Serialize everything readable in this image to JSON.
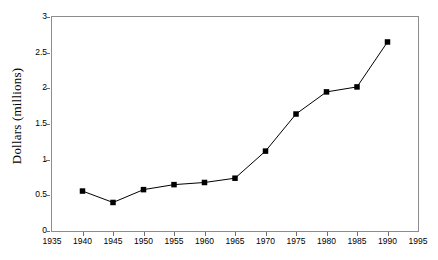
{
  "chart_data": {
    "type": "line",
    "title": "",
    "xlabel": "",
    "ylabel": "Dollars (millions)",
    "x": [
      1940,
      1945,
      1950,
      1955,
      1960,
      1965,
      1970,
      1975,
      1980,
      1985,
      1990
    ],
    "values": [
      0.56,
      0.4,
      0.58,
      0.65,
      0.68,
      0.74,
      1.12,
      1.64,
      1.95,
      2.02,
      2.65
    ],
    "series": [
      {
        "name": "Dollars (millions)",
        "values": [
          0.56,
          0.4,
          0.58,
          0.65,
          0.68,
          0.74,
          1.12,
          1.64,
          1.95,
          2.02,
          2.65
        ]
      }
    ],
    "xlim": [
      1935,
      1995
    ],
    "ylim": [
      0,
      3
    ],
    "xticks": [
      "1935",
      "1940",
      "1945",
      "1950",
      "1955",
      "1960",
      "1965",
      "1970",
      "1975",
      "1980",
      "1985",
      "1990",
      "1995"
    ],
    "xtick_values": [
      1935,
      1940,
      1945,
      1950,
      1955,
      1960,
      1965,
      1970,
      1975,
      1980,
      1985,
      1990,
      1995
    ],
    "yticks": [
      "0",
      "0.5",
      "1",
      "1.5",
      "2",
      "2.5",
      "3"
    ],
    "ytick_values": [
      0,
      0.5,
      1,
      1.5,
      2,
      2.5,
      3
    ],
    "grid": false,
    "legend": null,
    "legend_position": "none",
    "marker": "square",
    "line_color": "#000000",
    "marker_color": "#000000",
    "frame_color": "#8d8d8d"
  }
}
